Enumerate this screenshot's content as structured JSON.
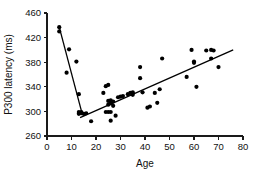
{
  "chart_data": {
    "type": "scatter",
    "title": "",
    "xlabel": "Age",
    "ylabel": "P300 latency (ms)",
    "xlim": [
      0,
      80
    ],
    "ylim": [
      260,
      460
    ],
    "xticks": [
      0,
      10,
      20,
      30,
      40,
      50,
      60,
      70,
      80
    ],
    "yticks": [
      260,
      300,
      340,
      380,
      420,
      460
    ],
    "grid": false,
    "legend": null,
    "point_color": "#000000",
    "line_color": "#000000",
    "series": [
      {
        "name": "P300 latency vs age",
        "x": [
          5,
          5,
          8,
          9,
          12,
          13,
          13,
          13,
          14,
          14,
          15,
          16,
          18,
          23,
          24,
          24,
          25,
          25,
          25,
          25,
          26,
          26,
          26,
          26,
          27,
          27,
          28,
          29,
          30,
          31,
          33,
          34,
          35,
          35,
          38,
          38,
          39,
          41,
          42,
          44,
          45,
          46,
          47,
          57,
          59,
          60,
          60,
          61,
          65,
          67,
          67,
          68,
          70
        ],
        "y": [
          437,
          430,
          363,
          401,
          381,
          328,
          299,
          296,
          299,
          297,
          296,
          297,
          284,
          330,
          341,
          299,
          343,
          311,
          317,
          299,
          318,
          313,
          299,
          285,
          316,
          309,
          293,
          323,
          324,
          325,
          328,
          330,
          331,
          327,
          372,
          354,
          331,
          306,
          308,
          330,
          314,
          336,
          386,
          356,
          400,
          381,
          379,
          340,
          399,
          400,
          386,
          399,
          372
        ]
      }
    ],
    "fits": [
      {
        "name": "descending-fit-children",
        "x0": 5,
        "y0": 437,
        "x1": 14.5,
        "y1": 294
      },
      {
        "name": "ascending-fit-adults",
        "x0": 13.5,
        "y0": 290,
        "x1": 76,
        "y1": 400
      }
    ]
  },
  "axes": {
    "x_title": "Age",
    "y_title": "P300 latency (ms)",
    "x_tick_labels": [
      "0",
      "10",
      "20",
      "30",
      "40",
      "50",
      "60",
      "70",
      "80"
    ],
    "y_tick_labels": [
      "260",
      "300",
      "340",
      "380",
      "420",
      "460"
    ]
  }
}
